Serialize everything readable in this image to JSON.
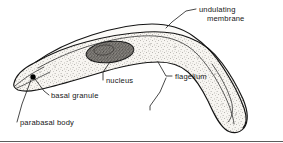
{
  "figure": {
    "caption_visible": false,
    "background_color": "#ffffff",
    "ink_color": "#141414",
    "body_fill_color": "#f5f3ef",
    "nucleus_color": "#3b3b3b",
    "granule_color": "#000000"
  },
  "labels": {
    "undulating_membrane_line1": "undulating",
    "undulating_membrane_line2": "membrane",
    "nucleus": "nucleus",
    "flagellum": "flagellum",
    "basal_granule": "basal granule",
    "parabasal_body": "parabasal body"
  },
  "structures": [
    {
      "name": "undulating-membrane",
      "label": "undulating membrane"
    },
    {
      "name": "nucleus",
      "label": "nucleus"
    },
    {
      "name": "flagellum",
      "label": "flagellum"
    },
    {
      "name": "basal-granule",
      "label": "basal granule"
    },
    {
      "name": "parabasal-body",
      "label": "parabasal body"
    },
    {
      "name": "cell-body",
      "label": "cell body"
    }
  ]
}
